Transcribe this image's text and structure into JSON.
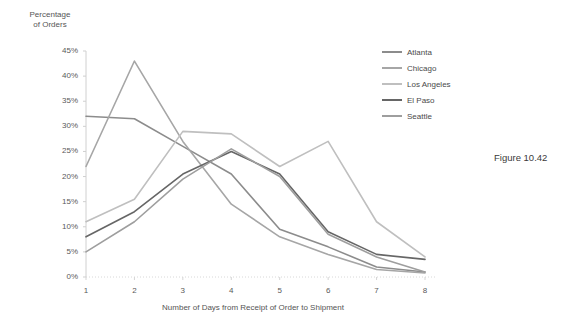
{
  "figure": {
    "label": "Figure 10.42"
  },
  "chart_data": {
    "type": "line",
    "title": "",
    "subtitle": "",
    "xlabel": "Number of Days from Receipt of Order to Shipment",
    "ylabel": "Percentage\nof Orders",
    "x": [
      1,
      2,
      3,
      4,
      5,
      6,
      7,
      8
    ],
    "categories": [
      "1",
      "2",
      "3",
      "4",
      "5",
      "6",
      "7",
      "8"
    ],
    "xtick_labels": [
      "1",
      "2",
      "3",
      "4",
      "5",
      "6",
      "7",
      "8"
    ],
    "ytick_labels": [
      "0%",
      "5%",
      "10%",
      "15%",
      "20%",
      "25%",
      "30%",
      "35%",
      "40%",
      "45%"
    ],
    "ytick_values": [
      0,
      5,
      10,
      15,
      20,
      25,
      30,
      35,
      40,
      45
    ],
    "ylim": [
      0,
      45
    ],
    "xlim": [
      1,
      8
    ],
    "grid": false,
    "legend_position": "right",
    "series": [
      {
        "name": "Atlanta",
        "color": "#8c8c8c",
        "values": [
          32,
          31.5,
          26,
          20.5,
          9.5,
          6,
          2,
          1
        ]
      },
      {
        "name": "Chicago",
        "color": "#a6a6a6",
        "values": [
          22,
          43,
          27,
          14.5,
          8,
          4.5,
          1.5,
          0.8
        ]
      },
      {
        "name": "Los Angeles",
        "color": "#bfbfbf",
        "values": [
          11,
          15.5,
          29,
          28.5,
          22,
          27,
          11,
          4
        ]
      },
      {
        "name": "El Paso",
        "color": "#666666",
        "values": [
          8,
          13,
          20.5,
          25,
          20.5,
          9,
          4.5,
          3.5
        ]
      },
      {
        "name": "Seattle",
        "color": "#9e9e9e",
        "values": [
          5,
          11,
          19.5,
          25.5,
          20,
          8.5,
          4,
          1
        ]
      }
    ]
  }
}
